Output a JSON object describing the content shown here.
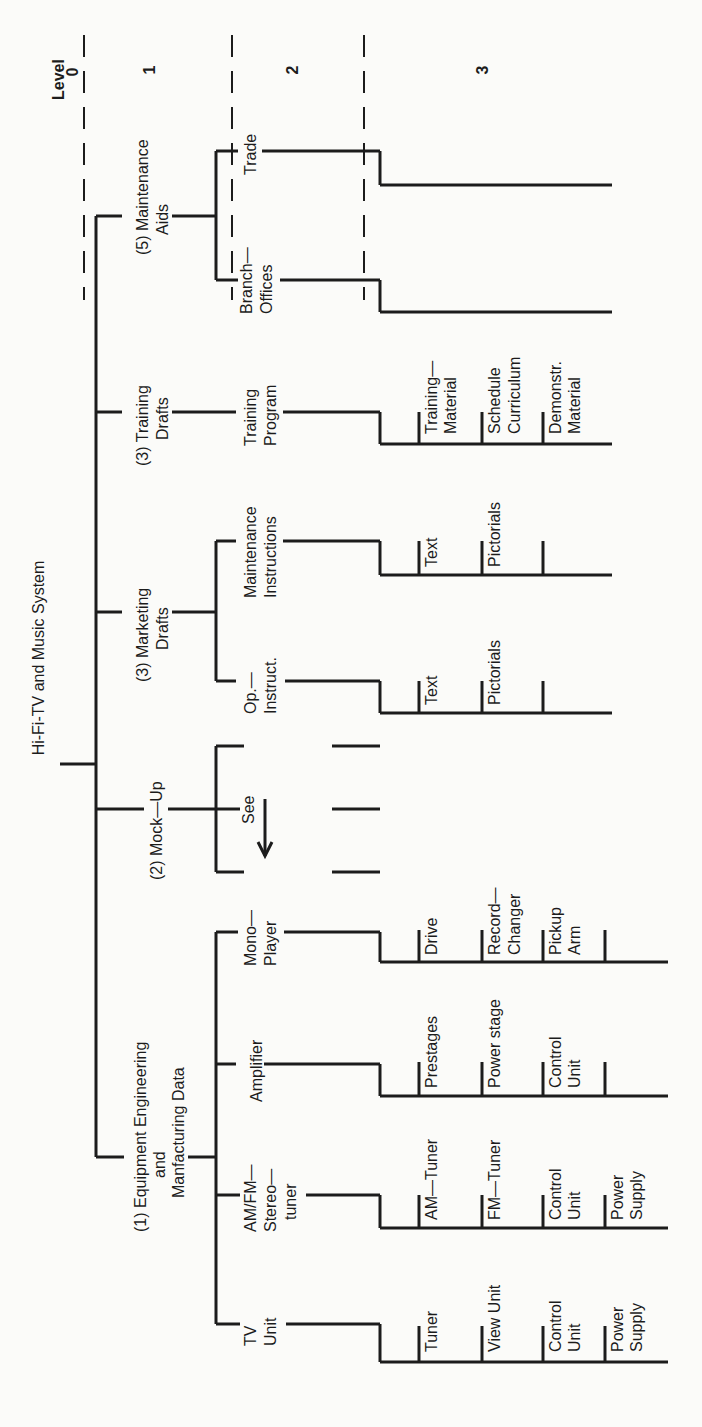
{
  "diagram": {
    "title": "Hi-Fi-TV and Music System",
    "levels": {
      "header": "Level",
      "labels": [
        "0",
        "1",
        "2",
        "3"
      ]
    },
    "branches": [
      {
        "id": "maintenance-aids",
        "label_lines": [
          "(5) Maintenance",
          "Aids"
        ],
        "children": [
          {
            "label_lines": [
              "Trade"
            ],
            "children": []
          },
          {
            "label_lines": [
              "Branch—",
              "Offices"
            ],
            "children": []
          }
        ]
      },
      {
        "id": "training-drafts",
        "label_lines": [
          "(3) Training",
          "Drafts"
        ],
        "children": [
          {
            "label_lines": [
              "Training",
              "Program"
            ],
            "children": [
              [
                "Training—",
                "Material"
              ],
              [
                "Schedule",
                "Curriculum"
              ],
              [
                "Demonstr.",
                "Material"
              ]
            ]
          }
        ]
      },
      {
        "id": "marketing-drafts",
        "label_lines": [
          "(3) Marketing",
          "Drafts"
        ],
        "children": [
          {
            "label_lines": [
              "Maintenance",
              "Instructions"
            ],
            "children": [
              [
                "Text"
              ],
              [
                "Pictorials"
              ],
              [
                ""
              ]
            ]
          },
          {
            "label_lines": [
              "Op.—",
              "Instruct."
            ],
            "children": [
              [
                "Text"
              ],
              [
                "Pictorials"
              ],
              [
                ""
              ]
            ]
          }
        ]
      },
      {
        "id": "mock-up",
        "label_lines": [
          "(2) Mock—Up"
        ],
        "see_label": "See",
        "children": []
      },
      {
        "id": "equipment-engineering",
        "label_lines": [
          "(1) Equipment  Engineering",
          "and",
          "Manfacturing  Data"
        ],
        "children": [
          {
            "label_lines": [
              "Mono—",
              "Player"
            ],
            "children": [
              [
                "Drive"
              ],
              [
                "Record—",
                "Changer"
              ],
              [
                "Pickup",
                "Arm"
              ],
              [
                ""
              ]
            ]
          },
          {
            "label_lines": [
              "Amplifier"
            ],
            "children": [
              [
                "Prestages"
              ],
              [
                "Power  stage"
              ],
              [
                "Control",
                "Unit"
              ],
              [
                ""
              ]
            ]
          },
          {
            "label_lines": [
              "AM/FM—",
              "Stereo—",
              "tuner"
            ],
            "children": [
              [
                "AM—Tuner"
              ],
              [
                "FM—Tuner"
              ],
              [
                "Control",
                "Unit"
              ],
              [
                "Power",
                "Supply"
              ]
            ]
          },
          {
            "label_lines": [
              "TV",
              "Unit"
            ],
            "children": [
              [
                "Tuner"
              ],
              [
                "View  Unit"
              ],
              [
                "Control",
                "Unit"
              ],
              [
                "Power",
                "Supply"
              ]
            ]
          }
        ]
      }
    ]
  },
  "colors": {
    "ink": "#1c1c1c",
    "paper": "#fbfbf9"
  }
}
